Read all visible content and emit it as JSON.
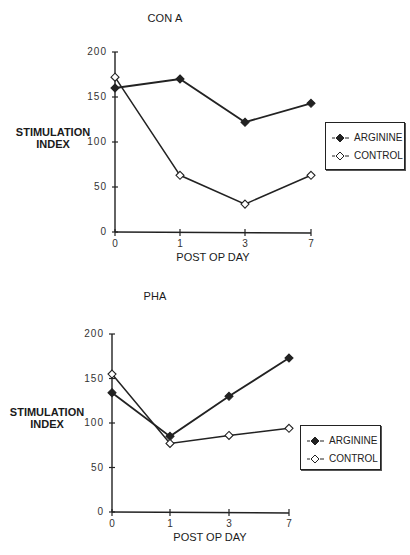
{
  "chart_data": [
    {
      "type": "line",
      "title": "CON A",
      "xlabel": "POST OP DAY",
      "ylabel": "STIMULATION INDEX",
      "ylabel_lines": [
        "STIMULATION",
        "INDEX"
      ],
      "x": [
        "0",
        "1",
        "3",
        "7"
      ],
      "ylim": [
        0,
        200
      ],
      "yticks": [
        "0",
        "50",
        "100",
        "150",
        "200"
      ],
      "grid": false,
      "legend_position": "right",
      "series": [
        {
          "name": "ARGININE",
          "marker": "filled-diamond",
          "values": [
            160,
            170,
            122,
            143
          ]
        },
        {
          "name": "CONTROL",
          "marker": "open-diamond",
          "values": [
            172,
            63,
            31,
            63
          ]
        }
      ]
    },
    {
      "type": "line",
      "title": "PHA",
      "xlabel": "POST OP DAY",
      "ylabel": "STIMULATION INDEX",
      "ylabel_lines": [
        "STIMULATION",
        "INDEX"
      ],
      "x": [
        "0",
        "1",
        "3",
        "7"
      ],
      "ylim": [
        0,
        200
      ],
      "yticks": [
        "0",
        "50",
        "100",
        "150",
        "200"
      ],
      "grid": false,
      "legend_position": "right",
      "series": [
        {
          "name": "ARGININE",
          "marker": "filled-diamond",
          "values": [
            134,
            85,
            130,
            173
          ]
        },
        {
          "name": "CONTROL",
          "marker": "open-diamond",
          "values": [
            155,
            77,
            86,
            94
          ]
        }
      ]
    }
  ],
  "colors": {
    "line": "#222222",
    "background": "#ffffff"
  }
}
